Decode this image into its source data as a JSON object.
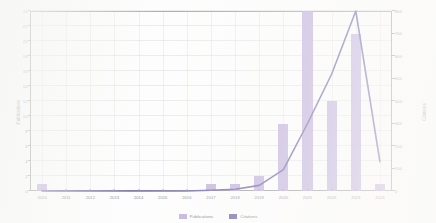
{
  "chart_data": {
    "type": "bar",
    "title": "",
    "xlabel": "",
    "ylabel": "Publications",
    "y2label": "Citations",
    "grid": true,
    "legend_position": "bottom-center",
    "categories": [
      "2010",
      "2011",
      "2012",
      "2013",
      "2014",
      "2015",
      "2016",
      "2017",
      "2018",
      "2019",
      "2020",
      "2021",
      "2022",
      "2023",
      "2024"
    ],
    "ylim": [
      0,
      24
    ],
    "yticks": [
      0,
      2,
      4,
      6,
      8,
      10,
      12,
      14,
      16,
      18,
      20,
      22,
      24
    ],
    "y2lim": [
      0,
      800
    ],
    "y2ticks": [
      0,
      100,
      200,
      300,
      400,
      500,
      600,
      700,
      800
    ],
    "series": [
      {
        "name": "Publications",
        "type": "bar",
        "axis": "left",
        "color": "#b3a0d6",
        "values": [
          1,
          0,
          0,
          0,
          0,
          0,
          0,
          1,
          1,
          2,
          9,
          24,
          12,
          21,
          1
        ]
      },
      {
        "name": "Citations",
        "type": "line",
        "axis": "right",
        "color": "#5b4f9b",
        "values": [
          0,
          0,
          0,
          0,
          0,
          0,
          0,
          3,
          8,
          25,
          95,
          300,
          520,
          800,
          130
        ]
      }
    ]
  },
  "legend": {
    "items": [
      {
        "label": "Publications",
        "color": "#b3a0d6"
      },
      {
        "label": "Citations",
        "color": "#5b4f9b"
      }
    ]
  }
}
